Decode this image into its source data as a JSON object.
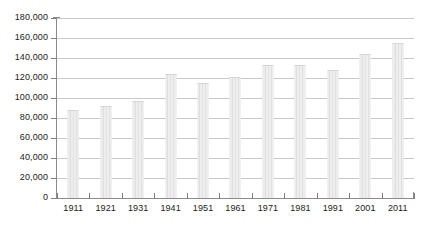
{
  "chart_data": {
    "type": "bar",
    "title": "",
    "subtitle": "",
    "xlabel": "",
    "ylabel": "",
    "categories": [
      "1911",
      "1921",
      "1931",
      "1941",
      "1951",
      "1961",
      "1971",
      "1981",
      "1991",
      "2001",
      "2011"
    ],
    "values": [
      87000,
      91000,
      96000,
      123000,
      114000,
      120000,
      132000,
      132000,
      127000,
      143000,
      154000
    ],
    "ylim": [
      0,
      180000
    ],
    "ytick_step": 20000,
    "ytick_labels": [
      "0",
      "20,000",
      "40,000",
      "60,000",
      "80,000",
      "100,000",
      "120,000",
      "140,000",
      "160,000",
      "180,000"
    ],
    "ytick_values": [
      0,
      20000,
      40000,
      60000,
      80000,
      100000,
      120000,
      140000,
      160000,
      180000
    ],
    "grid": "horizontal",
    "legend": "none",
    "series": [
      {
        "name": "Population",
        "values": [
          87000,
          91000,
          96000,
          123000,
          114000,
          120000,
          132000,
          132000,
          127000,
          143000,
          154000
        ]
      }
    ],
    "colors": {
      "bar_fill": "#e9e9e9",
      "bar_stripe": "#dedede",
      "gridline": "#c9c9c9",
      "axis": "#8a8a8a",
      "text": "#1b1b1b",
      "background": "#ffffff"
    }
  }
}
